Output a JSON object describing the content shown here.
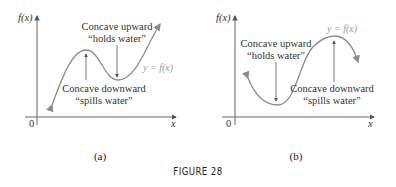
{
  "figure": {
    "caption": "FIGURE 28",
    "panels": [
      {
        "id": "a",
        "label": "(a)",
        "y_axis_label": "f(x)",
        "x_axis_label": "x",
        "origin_label": "0",
        "curve_label": "y = f(x)",
        "annotations": [
          {
            "line1": "Concave upward",
            "line2": "“holds water”"
          },
          {
            "line1": "Concave downward",
            "line2": "“spills water”"
          }
        ]
      },
      {
        "id": "b",
        "label": "(b)",
        "y_axis_label": "f(x)",
        "x_axis_label": "x",
        "origin_label": "0",
        "curve_label": "y = f(x)",
        "annotations": [
          {
            "line1": "Concave upward",
            "line2": "“holds water”"
          },
          {
            "line1": "Concave downward",
            "line2": "“spills water”"
          }
        ]
      }
    ]
  },
  "colors": {
    "curve": "#8c8c8c",
    "axis": "#555555",
    "text": "#333333"
  }
}
